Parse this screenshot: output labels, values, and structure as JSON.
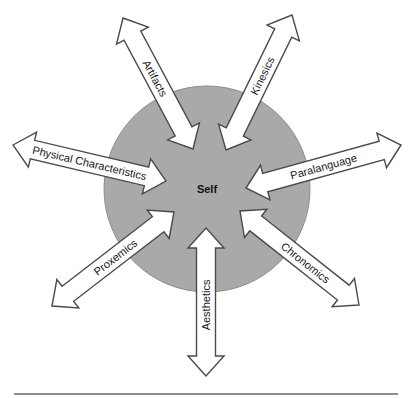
{
  "diagram": {
    "center": {
      "label": "Self",
      "x": 207,
      "y": 189,
      "r": 103,
      "fill": "#a9a9a9",
      "stroke": "#8c8c8c"
    },
    "baseline": {
      "x1": 14,
      "x2": 398,
      "y": 394,
      "color": "#6a6a6a"
    },
    "arrow_style": {
      "shaft_width": 19,
      "head_width": 36,
      "head_length": 20,
      "fill": "#ffffff",
      "stroke": "#4a4a4a"
    },
    "arrows": [
      {
        "label": "Artifacts",
        "outer": [
          123,
          18
        ],
        "inner": [
          193,
          149
        ],
        "label_pos": 0.46
      },
      {
        "label": "Kinesics",
        "outer": [
          292,
          15
        ],
        "inner": [
          226,
          150
        ],
        "label_pos": 0.45
      },
      {
        "label": "Physical Characteristics",
        "outer": [
          13,
          145
        ],
        "inner": [
          166,
          181
        ],
        "label_pos": 0.5
      },
      {
        "label": "Paralanguage",
        "outer": [
          401,
          145
        ],
        "inner": [
          246,
          188
        ],
        "label_pos": 0.5
      },
      {
        "label": "Proxemics",
        "outer": [
          52,
          306
        ],
        "inner": [
          174,
          212
        ],
        "label_pos": 0.52
      },
      {
        "label": "Chronomics",
        "outer": [
          359,
          305
        ],
        "inner": [
          240,
          211
        ],
        "label_pos": 0.45
      },
      {
        "label": "Aesthetics",
        "outer": [
          206,
          376
        ],
        "inner": [
          206,
          228
        ],
        "label_pos": 0.48
      }
    ]
  }
}
